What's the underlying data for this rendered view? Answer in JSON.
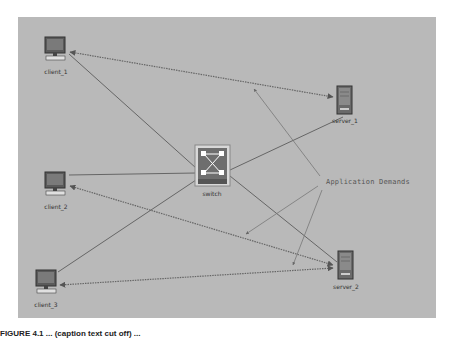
{
  "diagram": {
    "background_color": "#b9b9b9",
    "nodes": [
      {
        "id": "client_1",
        "label": "client_1",
        "type": "workstation"
      },
      {
        "id": "client_2",
        "label": "client_2",
        "type": "workstation"
      },
      {
        "id": "client_3",
        "label": "client_3",
        "type": "workstation"
      },
      {
        "id": "switch",
        "label": "switch",
        "type": "switch"
      },
      {
        "id": "server_1",
        "label": "server_1",
        "type": "server"
      },
      {
        "id": "server_2",
        "label": "server_2",
        "type": "server"
      }
    ],
    "links": [
      {
        "from": "client_1",
        "to": "switch",
        "style": "solid"
      },
      {
        "from": "client_2",
        "to": "switch",
        "style": "solid"
      },
      {
        "from": "client_3",
        "to": "switch",
        "style": "solid"
      },
      {
        "from": "switch",
        "to": "server_1",
        "style": "solid"
      },
      {
        "from": "switch",
        "to": "server_2",
        "style": "solid"
      }
    ],
    "demands": [
      {
        "from": "client_1",
        "to": "server_1",
        "style": "dotted"
      },
      {
        "from": "client_2",
        "to": "server_2",
        "style": "dotted"
      },
      {
        "from": "client_3",
        "to": "server_2",
        "style": "dotted"
      }
    ],
    "annotation": {
      "text": "Application Demands",
      "arrow_count": 3
    }
  },
  "caption": {
    "text": "FIGURE 4.1    ... (caption text cut off) ..."
  }
}
